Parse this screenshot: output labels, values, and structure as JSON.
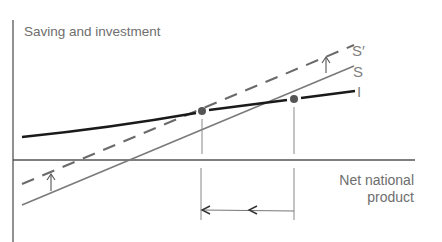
{
  "diagram": {
    "y_axis_label": "Saving and investment",
    "x_axis_label_line1": "Net national",
    "x_axis_label_line2": "product",
    "curves": [
      {
        "id": "s_prime",
        "label": "S′",
        "style": "dashed",
        "color": "#6a6a6a"
      },
      {
        "id": "s",
        "label": "S",
        "style": "solid",
        "color": "#7a7a7a"
      },
      {
        "id": "i",
        "label": "I",
        "style": "solid-thick",
        "color": "#1a1a1a"
      }
    ],
    "equilibria": [
      {
        "id": "new-equilibrium",
        "note": "intersection of I and S′"
      },
      {
        "id": "old-equilibrium",
        "note": "intersection of I and S"
      }
    ],
    "annotations": {
      "shift_arrows": "upward arrows indicating S shifts to S′",
      "output_change_arrow": "leftward arrows indicating decline in net national product"
    },
    "colors": {
      "axis": "#555555",
      "investment_line": "#1a1a1a",
      "saving_line": "#7a7a7a",
      "dot": "#555555",
      "text": "#6e6e6e"
    }
  }
}
